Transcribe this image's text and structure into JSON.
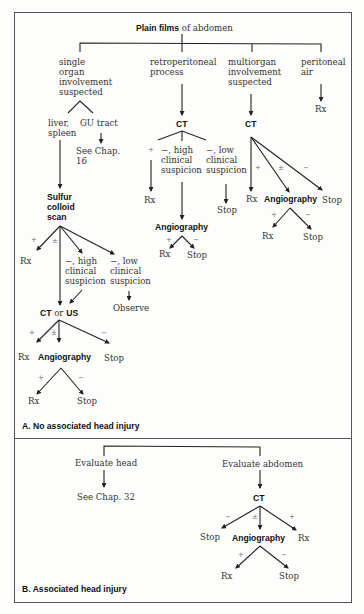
{
  "panel_a": {
    "caption": "A. No associated head injury",
    "root": {
      "bold": "Plain films",
      "rest": " of abdomen"
    },
    "branches": {
      "single": [
        "single",
        "organ",
        "involvement",
        "suspected"
      ],
      "retro": [
        "retroperitoneal",
        "process"
      ],
      "multi": [
        "multiorgan",
        "involvement",
        "suspected"
      ],
      "peritoneal": [
        "peritoneal",
        "air"
      ]
    },
    "single": {
      "liver": [
        "liver,",
        "spleen"
      ],
      "gu": "GU tract",
      "see_chap": [
        "See Chap.",
        "16"
      ],
      "scan": [
        "Sulfur",
        "colloid",
        "scan"
      ],
      "scan_plus": "+",
      "scan_pm": "±",
      "scan_rx": "Rx",
      "high": [
        "−, high",
        "clinical",
        "suspicion"
      ],
      "low": [
        "−, low",
        "clinical",
        "suspicion"
      ],
      "observe": "Observe",
      "ctus_bold1": "CT",
      "ctus_or": " or ",
      "ctus_bold2": "US",
      "ctus_plus": "+",
      "ctus_pm": "±",
      "ctus_minus": "−",
      "ctus_rx": "Rx",
      "ctus_angio": "Angiography",
      "ctus_stop": "Stop",
      "angio_plus": "+",
      "angio_minus": "−",
      "angio_rx": "Rx",
      "angio_stop": "Stop"
    },
    "retro": {
      "ct": "CT",
      "plus": "+",
      "rx": "Rx",
      "high": [
        "−, high",
        "clinical",
        "suspicion"
      ],
      "low": [
        "−, low",
        "clinical",
        "suspicion"
      ],
      "stop": "Stop",
      "angio": "Angiography",
      "angio_plus": "+",
      "angio_minus": "−",
      "angio_rx": "Rx",
      "angio_stop": "Stop"
    },
    "multi": {
      "ct": "CT",
      "plus": "+",
      "pm": "±",
      "minus": "−",
      "rx": "Rx",
      "angio": "Angiography",
      "stop": "Stop",
      "angio_plus": "+",
      "angio_minus": "−",
      "angio_rx": "Rx",
      "angio_stop": "Stop"
    },
    "peritoneal": {
      "rx": "Rx"
    }
  },
  "panel_b": {
    "caption": "B. Associated head injury",
    "head": "Evaluate head",
    "see_chap": "See Chap. 32",
    "abdomen": "Evaluate abdomen",
    "ct": "CT",
    "minus": "−",
    "pm": "±",
    "plus": "+",
    "stop": "Stop",
    "angio": "Angiography",
    "rx": "Rx",
    "angio_plus": "+",
    "angio_minus": "−",
    "angio_rx": "Rx",
    "angio_stop": "Stop"
  }
}
